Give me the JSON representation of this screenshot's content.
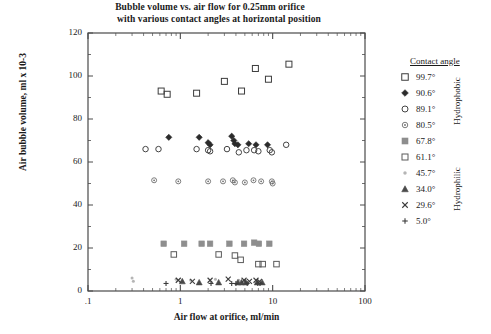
{
  "chart_data": {
    "type": "scatter",
    "title": "Bubble volume vs. air flow for 0.25mm orifice with various contact angles at horizontal position",
    "title_line1": "Bubble volume vs. air flow for 0.25mm orifice",
    "title_line2": "with various contact angles at horizontal position",
    "xlabel": "Air flow at orifice, ml/min",
    "ylabel": "Air bubble volume, ml x 10-3",
    "xscale": "log",
    "yscale": "linear",
    "xlim": [
      0.1,
      100
    ],
    "ylim": [
      0,
      120
    ],
    "grid": false,
    "legend_position": "right-outside",
    "legend_title": "Contact angle",
    "x_tick_labels": [
      ".1",
      "1",
      "10",
      "100"
    ],
    "x_tick_values": [
      0.1,
      1,
      10,
      100
    ],
    "y_tick_labels": [
      "0",
      "20",
      "40",
      "60",
      "80",
      "100",
      "120"
    ],
    "y_tick_values": [
      0,
      20,
      40,
      60,
      80,
      100,
      120
    ],
    "group_labels": [
      "Hydrophobic",
      "Hydrophilic"
    ],
    "series": [
      {
        "name": "99.7°",
        "marker": "open-square",
        "color": "#3c3c3c",
        "size": 6,
        "group": "Hydrophobic",
        "points": [
          [
            0.62,
            93.0
          ],
          [
            0.72,
            91.5
          ],
          [
            1.5,
            92.0
          ],
          [
            3.0,
            97.5
          ],
          [
            4.6,
            93.0
          ],
          [
            6.5,
            103.5
          ],
          [
            9.0,
            98.5
          ],
          [
            15.0,
            105.5
          ]
        ]
      },
      {
        "name": "90.6°",
        "marker": "filled-diamond",
        "color": "#2b2b2b",
        "size": 5,
        "group": "Hydrophobic",
        "points": [
          [
            0.75,
            71.5
          ],
          [
            1.6,
            71.5
          ],
          [
            2.0,
            69.0
          ],
          [
            2.1,
            68.0
          ],
          [
            3.6,
            72.0
          ],
          [
            3.8,
            70.0
          ],
          [
            3.9,
            68.5
          ],
          [
            4.2,
            68.0
          ],
          [
            5.5,
            68.5
          ],
          [
            6.6,
            68.0
          ],
          [
            8.8,
            68.0
          ]
        ]
      },
      {
        "name": "89.1°",
        "marker": "open-circle",
        "color": "#444444",
        "size": 5.5,
        "group": "Hydrophobic",
        "points": [
          [
            0.42,
            66.0
          ],
          [
            0.58,
            66.0
          ],
          [
            1.5,
            66.0
          ],
          [
            2.0,
            65.5
          ],
          [
            2.1,
            65.0
          ],
          [
            3.2,
            66.0
          ],
          [
            4.3,
            64.5
          ],
          [
            5.2,
            65.5
          ],
          [
            6.3,
            65.5
          ],
          [
            7.0,
            65.0
          ],
          [
            9.3,
            65.5
          ],
          [
            9.8,
            64.5
          ],
          [
            14.0,
            68.0
          ]
        ]
      },
      {
        "name": "80.5°",
        "marker": "dotted-circle",
        "color": "#6e6e6e",
        "size": 5,
        "group": "Hydrophobic",
        "points": [
          [
            0.52,
            51.5
          ],
          [
            0.95,
            51.0
          ],
          [
            2.0,
            51.0
          ],
          [
            2.9,
            51.0
          ],
          [
            3.7,
            51.5
          ],
          [
            3.9,
            50.5
          ],
          [
            5.0,
            50.5
          ],
          [
            6.2,
            51.5
          ],
          [
            7.5,
            51.0
          ],
          [
            9.8,
            51.0
          ],
          [
            10.0,
            50.0
          ]
        ]
      },
      {
        "name": "67.8°",
        "marker": "filled-square-gray",
        "color": "#8e8e8e",
        "size": 5.5,
        "group": "Hydrophobic",
        "points": [
          [
            0.66,
            22.0
          ],
          [
            1.1,
            22.0
          ],
          [
            1.7,
            22.0
          ],
          [
            2.1,
            22.0
          ],
          [
            3.4,
            22.0
          ],
          [
            4.9,
            22.0
          ],
          [
            6.3,
            22.5
          ],
          [
            7.1,
            22.0
          ],
          [
            9.2,
            22.0
          ]
        ]
      },
      {
        "name": "61.1°",
        "marker": "open-square",
        "color": "#5a5a5a",
        "size": 5.5,
        "group": "Hydrophobic",
        "points": [
          [
            0.85,
            17.0
          ],
          [
            2.6,
            17.0
          ],
          [
            3.9,
            16.5
          ],
          [
            4.5,
            14.5
          ],
          [
            7.0,
            12.5
          ],
          [
            7.8,
            12.5
          ],
          [
            11.0,
            12.5
          ]
        ]
      },
      {
        "name": "45.7°",
        "marker": "small-dot",
        "color": "#b5b5b5",
        "size": 3,
        "group": "Hydrophilic",
        "points": [
          [
            0.3,
            6.0
          ],
          [
            0.31,
            4.5
          ],
          [
            0.9,
            5.5
          ],
          [
            1.3,
            5.0
          ],
          [
            2.4,
            5.5
          ],
          [
            4.3,
            5.0
          ],
          [
            5.0,
            5.0
          ]
        ]
      },
      {
        "name": "34.0°",
        "marker": "filled-triangle",
        "color": "#4a4a4a",
        "size": 5,
        "group": "Hydrophilic",
        "points": [
          [
            1.05,
            4.5
          ],
          [
            1.6,
            4.0
          ],
          [
            2.6,
            4.0
          ],
          [
            4.2,
            4.0
          ],
          [
            4.6,
            4.0
          ],
          [
            5.1,
            4.0
          ],
          [
            6.8,
            4.0
          ],
          [
            7.7,
            4.0
          ]
        ]
      },
      {
        "name": "29.6°",
        "marker": "cross-x",
        "color": "#3c3c3c",
        "size": 5,
        "group": "Hydrophilic",
        "points": [
          [
            0.95,
            5.0
          ],
          [
            1.35,
            4.5
          ],
          [
            2.1,
            5.0
          ],
          [
            3.3,
            5.5
          ],
          [
            4.9,
            5.0
          ],
          [
            5.6,
            4.5
          ],
          [
            6.6,
            5.0
          ],
          [
            7.2,
            4.5
          ]
        ]
      },
      {
        "name": "5.0°",
        "marker": "plus",
        "color": "#3c3c3c",
        "size": 5,
        "group": "Hydrophilic",
        "points": [
          [
            0.7,
            3.5
          ],
          [
            2.15,
            3.5
          ],
          [
            3.6,
            3.5
          ],
          [
            4.0,
            3.5
          ],
          [
            5.3,
            3.5
          ],
          [
            6.9,
            3.5
          ],
          [
            7.3,
            3.5
          ]
        ]
      }
    ]
  },
  "plot_geometry": {
    "left": 88,
    "right": 365,
    "top": 33,
    "bottom": 291
  }
}
